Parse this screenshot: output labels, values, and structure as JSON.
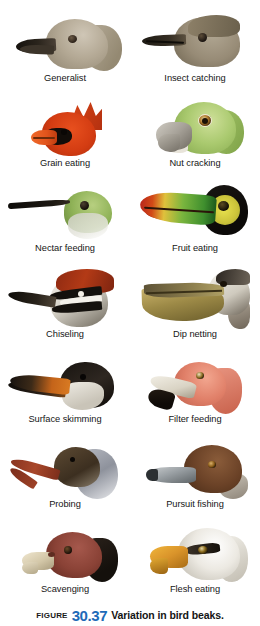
{
  "figure": {
    "label_prefix": "Figure",
    "number": "30.37",
    "title": "Variation in bird beaks.",
    "accent_color": "#1e6bb8",
    "background_color": "#ffffff",
    "text_color": "#161616",
    "columns": 2,
    "rows": 7,
    "total_panels": 14
  },
  "panels": [
    {
      "label": "Generalist",
      "bird": "gull",
      "icon": "gull-head-icon"
    },
    {
      "label": "Insect catching",
      "bird": "flycatcher",
      "icon": "flycatcher-head-icon"
    },
    {
      "label": "Grain eating",
      "bird": "cardinal",
      "icon": "cardinal-head-icon"
    },
    {
      "label": "Nut cracking",
      "bird": "parrot",
      "icon": "parrot-head-icon"
    },
    {
      "label": "Nectar feeding",
      "bird": "hummingbird",
      "icon": "hummingbird-head-icon"
    },
    {
      "label": "Fruit eating",
      "bird": "toucan",
      "icon": "toucan-head-icon"
    },
    {
      "label": "Chiseling",
      "bird": "woodpecker",
      "icon": "woodpecker-head-icon"
    },
    {
      "label": "Dip netting",
      "bird": "pelican",
      "icon": "pelican-head-icon"
    },
    {
      "label": "Surface skimming",
      "bird": "skimmer",
      "icon": "skimmer-head-icon"
    },
    {
      "label": "Filter feeding",
      "bird": "flamingo",
      "icon": "flamingo-head-icon"
    },
    {
      "label": "Probing",
      "bird": "ibis",
      "icon": "ibis-head-icon"
    },
    {
      "label": "Pursuit fishing",
      "bird": "duck",
      "icon": "duck-head-icon"
    },
    {
      "label": "Scavenging",
      "bird": "vulture",
      "icon": "vulture-head-icon"
    },
    {
      "label": "Flesh eating",
      "bird": "eagle",
      "icon": "eagle-head-icon"
    }
  ]
}
